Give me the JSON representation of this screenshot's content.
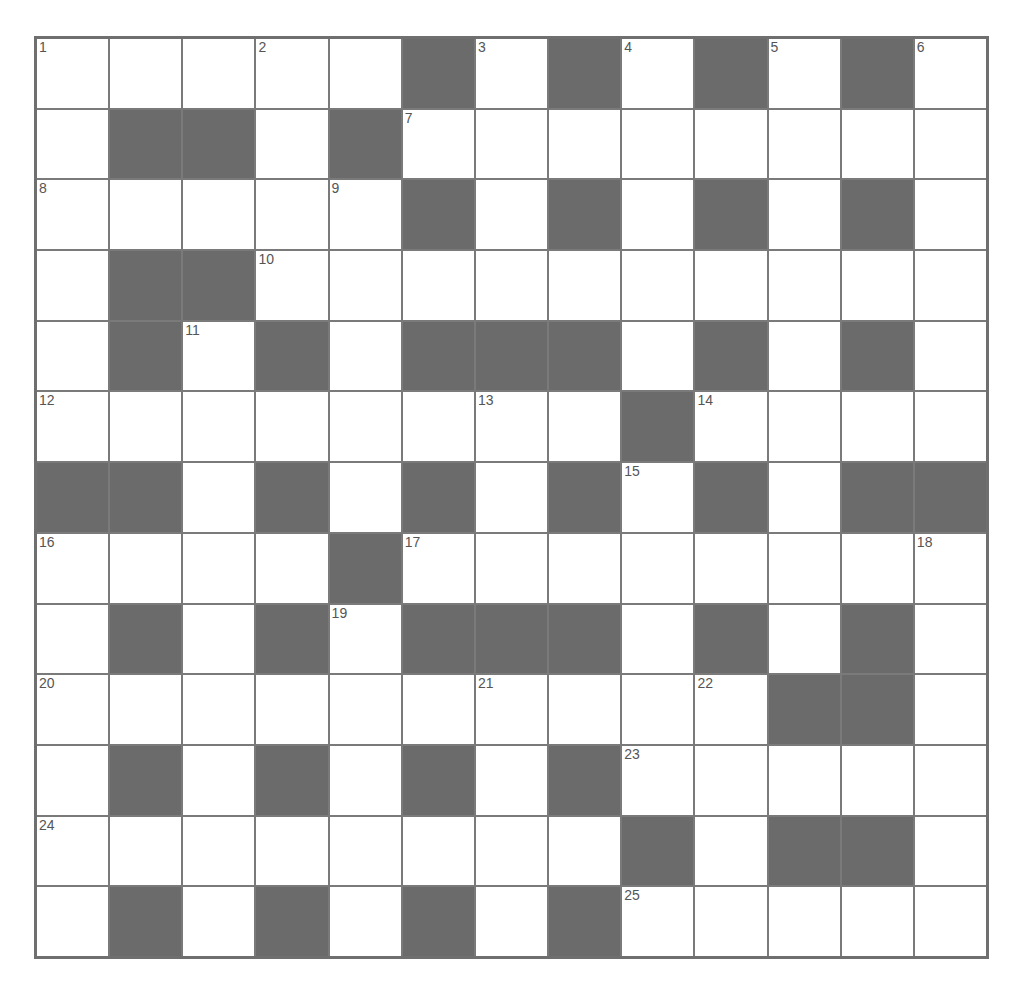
{
  "puzzle": {
    "rows": 13,
    "cols": 13,
    "colors": {
      "block": "#6b6b6b",
      "line": "#7a7a7a",
      "cell": "#ffffff",
      "number": "#555555"
    },
    "layout": [
      ".....#.#.#.#.",
      ".##.#........",
      ".....#.#.#.#.",
      ".##..........",
      ".#.#.###.#.#.",
      "........#....",
      "##.#.#.#.#.##",
      "....#........",
      ".#.#.###.#.#.",
      "..........##.",
      ".#.#.#.#.....",
      "........#.##.",
      ".#.#.#.#....."
    ],
    "numbers": [
      {
        "r": 0,
        "c": 0,
        "n": "1"
      },
      {
        "r": 0,
        "c": 3,
        "n": "2"
      },
      {
        "r": 0,
        "c": 6,
        "n": "3"
      },
      {
        "r": 0,
        "c": 8,
        "n": "4"
      },
      {
        "r": 0,
        "c": 10,
        "n": "5"
      },
      {
        "r": 0,
        "c": 12,
        "n": "6"
      },
      {
        "r": 1,
        "c": 5,
        "n": "7"
      },
      {
        "r": 2,
        "c": 0,
        "n": "8"
      },
      {
        "r": 2,
        "c": 4,
        "n": "9"
      },
      {
        "r": 3,
        "c": 3,
        "n": "10"
      },
      {
        "r": 4,
        "c": 2,
        "n": "11"
      },
      {
        "r": 5,
        "c": 0,
        "n": "12"
      },
      {
        "r": 5,
        "c": 6,
        "n": "13"
      },
      {
        "r": 5,
        "c": 9,
        "n": "14"
      },
      {
        "r": 6,
        "c": 8,
        "n": "15"
      },
      {
        "r": 7,
        "c": 0,
        "n": "16"
      },
      {
        "r": 7,
        "c": 5,
        "n": "17"
      },
      {
        "r": 7,
        "c": 12,
        "n": "18"
      },
      {
        "r": 8,
        "c": 4,
        "n": "19"
      },
      {
        "r": 9,
        "c": 0,
        "n": "20"
      },
      {
        "r": 9,
        "c": 6,
        "n": "21"
      },
      {
        "r": 9,
        "c": 9,
        "n": "22"
      },
      {
        "r": 10,
        "c": 8,
        "n": "23"
      },
      {
        "r": 11,
        "c": 0,
        "n": "24"
      },
      {
        "r": 12,
        "c": 8,
        "n": "25"
      }
    ],
    "entries": {
      "across": [
        "1",
        "7",
        "8",
        "10",
        "12",
        "14",
        "16",
        "17",
        "20",
        "23",
        "24",
        "25"
      ],
      "down": [
        "1",
        "2",
        "3",
        "4",
        "5",
        "6",
        "9",
        "11",
        "13",
        "15",
        "16",
        "18",
        "19",
        "21",
        "22"
      ]
    }
  }
}
